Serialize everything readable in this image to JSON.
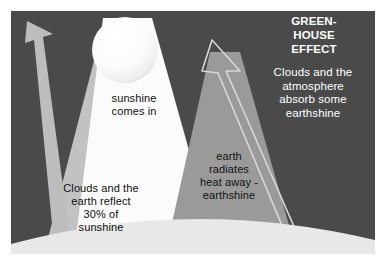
{
  "figure": {
    "name": "greenhouse-effect-diagram",
    "frame": {
      "outer_background": "#ffffff",
      "panel_background": "#4a4a4a",
      "panel_left": 11,
      "panel_top": 11,
      "panel_width": 364,
      "panel_height": 243
    },
    "title": {
      "text": "GREEN-\nHOUSE\nEFFECT",
      "color": "#ffffff"
    },
    "labels": {
      "absorb": {
        "text": "Clouds and the\natmosphere\nabsorb some\nearthshine",
        "color": "#ffffff"
      },
      "sunshine": {
        "text": "sunshine\ncomes in",
        "color": "#111111"
      },
      "reflect": {
        "text": "Clouds and the\nearth reflect\n30% of\nsunshine",
        "color": "#111111"
      },
      "earthshine": {
        "text": "earth\nradiates\nheat away -\nearthshine",
        "color": "#111111"
      }
    },
    "shapes": {
      "sun": {
        "name": "sun-sphere",
        "color": "#fcfcfc",
        "shadow_color": "#d8d8d8",
        "cx": 125,
        "cy": 50,
        "r": 33
      },
      "sunbeam": {
        "name": "incoming-sunbeam",
        "color": "#fbfbfb"
      },
      "reflected_beam": {
        "name": "reflected-sunlight-wedge",
        "color": "#c2c2c2"
      },
      "reflected_arrow": {
        "name": "reflected-sunshine-arrow",
        "color": "#bdbdbd"
      },
      "earthshine_cone": {
        "name": "earthshine-cone",
        "color": "#9a9a9a"
      },
      "escaping_arrow": {
        "name": "escaping-earthshine-arrow",
        "stroke": "#d5d5d5",
        "fill": "none"
      },
      "earth": {
        "name": "earth-surface-arc",
        "color": "#e8e8e8"
      }
    }
  }
}
